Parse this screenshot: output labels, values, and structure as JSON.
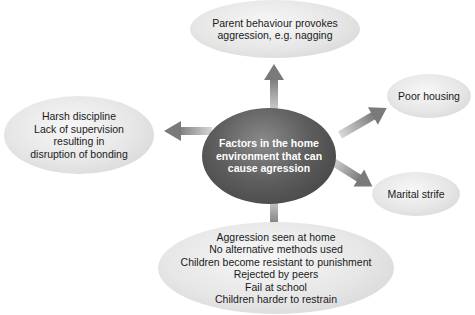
{
  "diagram": {
    "center": {
      "lines": [
        "Factors in the home",
        "environment that can",
        "cause agression"
      ]
    },
    "nodes": {
      "top": {
        "lines": [
          "Parent behaviour provokes",
          "aggression, e.g. nagging"
        ]
      },
      "left": {
        "lines": [
          "Harsh discipline",
          "Lack of supervision",
          "resulting in",
          "disruption of bonding"
        ]
      },
      "right_top": {
        "lines": [
          "Poor housing"
        ]
      },
      "right_bottom": {
        "lines": [
          "Marital strife"
        ]
      },
      "bottom": {
        "lines": [
          "Aggression seen at home",
          "No alternative methods used",
          "Children become resistant to punishment",
          "Rejected by peers",
          "Fail at school",
          "Children harder to restrain"
        ]
      }
    },
    "colors": {
      "center_fill": "#555555",
      "leaf_fill": "#e6e6e6",
      "arrow": "#8c8c8c",
      "text_dark": "#1a1a1a",
      "text_light": "#ffffff"
    }
  }
}
